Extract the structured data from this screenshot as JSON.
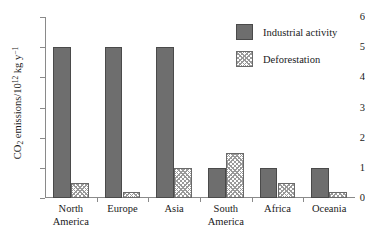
{
  "chart_data": {
    "type": "bar",
    "title": "",
    "xlabel": "",
    "ylabel": "CO2 emissions/10^12 kg y^-1",
    "ylabel_parts": {
      "prefix": "CO",
      "sub": "2",
      "mid": " emissions/10",
      "sup_exp": "12",
      "unit": " kg y",
      "sup_unit": "−1"
    },
    "categories": [
      "North America",
      "Europe",
      "Asia",
      "South America",
      "Africa",
      "Oceania"
    ],
    "category_lines": [
      [
        "North",
        "America"
      ],
      [
        "Europe",
        ""
      ],
      [
        "Asia",
        ""
      ],
      [
        "South",
        "America"
      ],
      [
        "Africa",
        ""
      ],
      [
        "Oceania",
        ""
      ]
    ],
    "series": [
      {
        "name": "Industrial activity",
        "pattern": "solid",
        "color": "#6e6e6e",
        "values": [
          5.0,
          5.0,
          5.0,
          1.0,
          1.0,
          1.0
        ]
      },
      {
        "name": "Deforestation",
        "pattern": "hatch",
        "color": "#ffffff",
        "values": [
          0.5,
          0.2,
          1.0,
          1.5,
          0.5,
          0.2
        ]
      }
    ],
    "ylim": [
      0,
      6
    ],
    "yticks": [
      0,
      1,
      2,
      3,
      4,
      5,
      6
    ],
    "ytick_labels": [
      "0",
      "1",
      "2",
      "3",
      "4",
      "5",
      "6"
    ],
    "grid": false,
    "legend_position": "top-right",
    "axis_color": "#8a8a8a"
  }
}
